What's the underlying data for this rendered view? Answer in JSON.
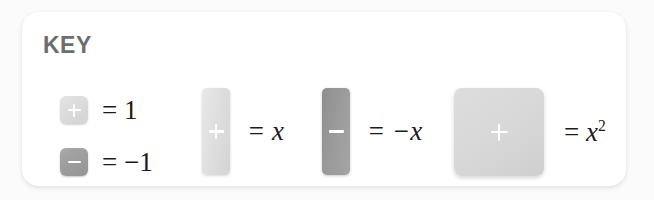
{
  "card": {
    "title": "KEY",
    "background_color": "#ffffff",
    "page_background_color": "#fbfbfb"
  },
  "legend": [
    {
      "id": "unit-positive",
      "tile_shape": "small-square",
      "tile_glyph": "plus",
      "tile_color": "#dcdcdc",
      "equals": "=",
      "value": "1",
      "label": "= 1"
    },
    {
      "id": "unit-negative",
      "tile_shape": "small-square",
      "tile_glyph": "minus",
      "tile_color": "#9e9e9e",
      "equals": "=",
      "value": "−1",
      "label": "= −1"
    },
    {
      "id": "x-positive",
      "tile_shape": "tall-bar",
      "tile_glyph": "plus",
      "tile_color": "#e0e0e0",
      "equals": "=",
      "value": "x",
      "label": "= x"
    },
    {
      "id": "x-negative",
      "tile_shape": "tall-bar",
      "tile_glyph": "minus",
      "tile_color": "#9a9a9a",
      "equals": "=",
      "value": "−x",
      "label": "= −x"
    },
    {
      "id": "x-squared",
      "tile_shape": "large-square",
      "tile_glyph": "plus",
      "tile_color": "#d8d8d8",
      "equals": "=",
      "value": "x",
      "exponent": "2",
      "label": "= x²"
    }
  ]
}
